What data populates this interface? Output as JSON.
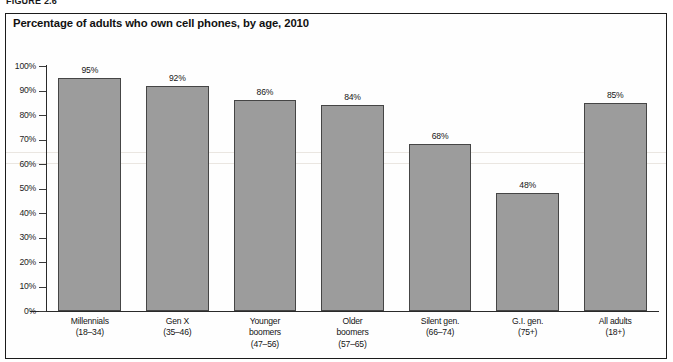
{
  "figure": {
    "caption": "FIGURE 2.6"
  },
  "chart_data": {
    "type": "bar",
    "title": "Percentage of adults who own cell phones, by age, 2010",
    "xlabel": "",
    "ylabel": "",
    "ylim": [
      0,
      100
    ],
    "grid": false,
    "legend": "none",
    "categories": [
      "Millennials",
      "Gen X",
      "Younger boomers",
      "Older boomers",
      "Silent gen.",
      "G.I. gen.",
      "All adults"
    ],
    "category_lines": [
      [
        "Millennials",
        "(18–34)"
      ],
      [
        "Gen X",
        "(35–46)"
      ],
      [
        "Younger",
        "boomers",
        "(47–56)"
      ],
      [
        "Older",
        "boomers",
        "(57–65)"
      ],
      [
        "Silent gen.",
        "(66–74)"
      ],
      [
        "G.I. gen.",
        "(75+)"
      ],
      [
        "All adults",
        "(18+)"
      ]
    ],
    "values": [
      95,
      92,
      86,
      84,
      68,
      48,
      85
    ],
    "value_labels": [
      "95%",
      "92%",
      "86%",
      "84%",
      "68%",
      "48%",
      "85%"
    ],
    "ytick_values": [
      0,
      10,
      20,
      30,
      40,
      50,
      60,
      70,
      80,
      90,
      100
    ],
    "ytick_labels": [
      "0%",
      "10%",
      "20%",
      "30%",
      "40%",
      "50%",
      "60%",
      "70%",
      "80%",
      "90%",
      "100%"
    ],
    "bar_color": "#9c9c9c",
    "bar_border_color": "#454545",
    "axis_color": "#2a2a2a",
    "text_color": "#151515"
  }
}
